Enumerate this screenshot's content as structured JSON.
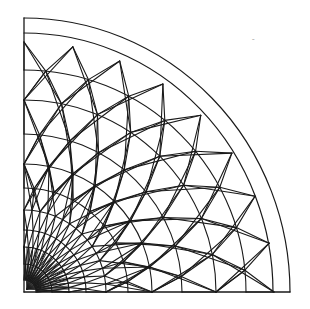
{
  "diagram": {
    "type": "dome-lattice-quadrant-plan",
    "canvas": {
      "width": 310,
      "height": 309
    },
    "colors": {
      "line": "#1a1a1a",
      "background": "#ffffff"
    },
    "origin": {
      "x": 24,
      "y": 292
    },
    "scale_y": 1.0,
    "outer_arcs": [
      {
        "name": "outer-rim-arc",
        "rx": 266,
        "ry": 274
      },
      {
        "name": "inner-rim-arc",
        "rx": 249,
        "ry": 259
      }
    ],
    "frame": {
      "left_edge_top_y": 18,
      "bottom_edge_right_x": 290
    },
    "rings": [
      {
        "r": 12,
        "divisions": 16,
        "offset": 0
      },
      {
        "r": 28,
        "divisions": 16,
        "offset": 0.5
      },
      {
        "r": 45,
        "divisions": 16,
        "offset": 0
      },
      {
        "r": 62,
        "divisions": 16,
        "offset": 0.5
      },
      {
        "r": 82,
        "divisions": 16,
        "offset": 0
      },
      {
        "r": 104,
        "divisions": 8,
        "offset": 0.5
      },
      {
        "r": 128,
        "divisions": 8,
        "offset": 0
      },
      {
        "r": 158,
        "divisions": 8,
        "offset": 0.5
      },
      {
        "r": 192,
        "divisions": 8,
        "offset": 0
      },
      {
        "r": 222,
        "divisions": 8,
        "offset": 0.5
      },
      {
        "r": 250,
        "divisions": 8,
        "offset": 0
      }
    ],
    "center_fan": {
      "spokes": 24,
      "r": 45
    },
    "stray_mark": {
      "x": 252,
      "y": 44,
      "text": "ˉ"
    }
  }
}
